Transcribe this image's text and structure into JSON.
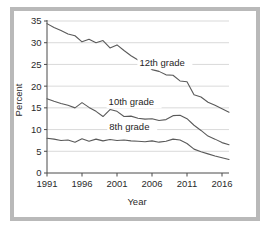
{
  "figure": {
    "frame_color": "#b9b9b9",
    "background": "#ffffff",
    "line_color": "#5a5a5a",
    "grid_color": "#c9c9c9"
  },
  "chart_data": {
    "type": "line",
    "title": "",
    "xlabel": "Year",
    "ylabel": "Percent",
    "xlim": [
      1991,
      2017
    ],
    "ylim": [
      0,
      35
    ],
    "xticks": [
      1991,
      1996,
      2001,
      2006,
      2011,
      2016
    ],
    "yticks": [
      0,
      5,
      10,
      15,
      20,
      25,
      30,
      35
    ],
    "grid": "horizontal",
    "legend_position": "inline-annotations",
    "x": [
      1991,
      1992,
      1993,
      1994,
      1995,
      1996,
      1997,
      1998,
      1999,
      2000,
      2001,
      2002,
      2003,
      2004,
      2005,
      2006,
      2007,
      2008,
      2009,
      2010,
      2011,
      2012,
      2013,
      2014,
      2015,
      2016,
      2017
    ],
    "series": [
      {
        "name": "12th grade",
        "label": "12th grade",
        "values": [
          34.4,
          33.5,
          32.8,
          32.0,
          31.6,
          30.2,
          30.8,
          30.0,
          30.5,
          28.8,
          29.5,
          28.2,
          27.0,
          26.0,
          25.1,
          23.8,
          23.4,
          22.6,
          22.5,
          21.2,
          21.0,
          18.0,
          17.5,
          16.3,
          15.6,
          14.8,
          14.0
        ]
      },
      {
        "name": "10th grade",
        "label": "10th grade",
        "values": [
          17.1,
          16.5,
          16.0,
          15.6,
          15.0,
          16.2,
          15.1,
          14.2,
          13.0,
          14.6,
          14.2,
          13.0,
          13.1,
          12.6,
          12.4,
          12.5,
          12.1,
          12.3,
          13.2,
          13.3,
          12.5,
          11.0,
          9.8,
          8.5,
          7.8,
          7.0,
          6.5
        ]
      },
      {
        "name": "8th grade",
        "label": "8th grade",
        "values": [
          8.0,
          7.8,
          7.5,
          7.6,
          7.1,
          7.9,
          7.3,
          7.8,
          7.4,
          7.7,
          7.5,
          7.6,
          7.4,
          7.3,
          7.2,
          7.4,
          7.1,
          7.3,
          7.8,
          7.6,
          6.8,
          5.5,
          4.9,
          4.4,
          3.9,
          3.5,
          3.1
        ]
      }
    ],
    "annotations": [
      {
        "text": "12th grade",
        "x": 2004.2,
        "y": 24.6
      },
      {
        "text": "10th grade",
        "x": 1999.8,
        "y": 15.6
      },
      {
        "text": "8th grade",
        "x": 1999.9,
        "y": 10.0
      }
    ]
  }
}
